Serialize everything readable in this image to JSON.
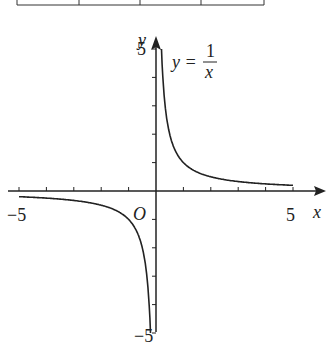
{
  "chart_data": {
    "type": "line",
    "title": "",
    "function": "y = 1/x",
    "series": [
      {
        "name": "y=1/x (x>0)",
        "x": [
          0.2,
          0.25,
          0.3,
          0.4,
          0.5,
          0.75,
          1,
          1.5,
          2,
          3,
          4,
          5
        ],
        "y": [
          5,
          4,
          3.33,
          2.5,
          2,
          1.33,
          1,
          0.67,
          0.5,
          0.33,
          0.25,
          0.2
        ]
      },
      {
        "name": "y=1/x (x<0)",
        "x": [
          -5,
          -4,
          -3,
          -2,
          -1.5,
          -1,
          -0.75,
          -0.5,
          -0.4,
          -0.3,
          -0.25,
          -0.2
        ],
        "y": [
          -0.2,
          -0.25,
          -0.33,
          -0.5,
          -0.67,
          -1,
          -1.33,
          -2,
          -2.5,
          -3.33,
          -4,
          -5
        ]
      }
    ],
    "xlabel": "x",
    "ylabel": "y",
    "xlim": [
      -5,
      5
    ],
    "ylim": [
      -5,
      5
    ],
    "x_ticks": [
      -5,
      -4,
      -3,
      -2,
      -1,
      0,
      1,
      2,
      3,
      4,
      5
    ],
    "y_ticks": [
      -5,
      -4,
      -3,
      -2,
      -1,
      0,
      1,
      2,
      3,
      4,
      5
    ],
    "grid": false,
    "annotations": {
      "origin": "O",
      "equation_lhs": "y =",
      "numerator": "1",
      "denominator": "x"
    },
    "tick_labels": {
      "x_min": "−5",
      "x_max": "5",
      "y_min": "−5",
      "y_max": "5"
    }
  }
}
